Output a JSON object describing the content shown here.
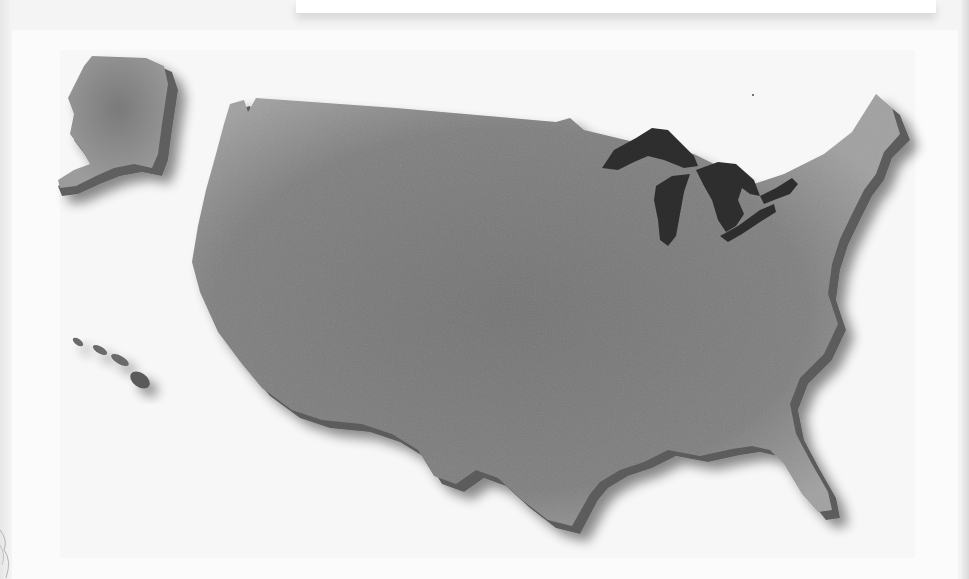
{
  "image": {
    "description": "Grayscale 3D relief map of the United States on a white card",
    "regions": [
      {
        "id": "contiguous-us",
        "label": "Contiguous United States"
      },
      {
        "id": "alaska",
        "label": "Alaska"
      },
      {
        "id": "hawaii",
        "label": "Hawaii"
      },
      {
        "id": "great-lakes",
        "label": "Great Lakes"
      }
    ]
  },
  "colors": {
    "background": "#f4f4f4",
    "card": "#fbfbfb",
    "land_top": "#8a8a8a",
    "land_center": "#767676",
    "land_edge_highlight": "#a3a3a3",
    "extrusion_side": "#5c5c5c",
    "lakes": "#2e2e2e",
    "shadow": "#000000"
  }
}
